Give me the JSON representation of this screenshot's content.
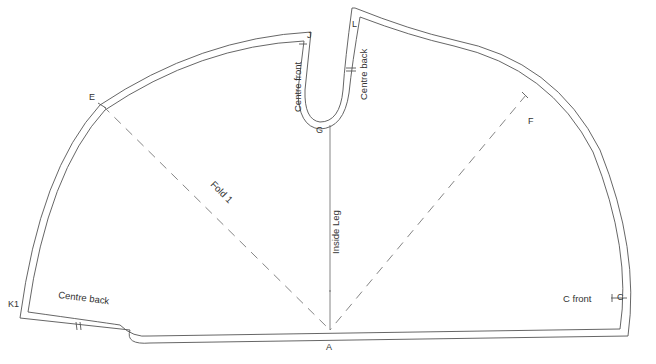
{
  "diagram": {
    "type": "sewing-pattern",
    "colors": {
      "line": "#555555",
      "text": "#333333",
      "background": "#ffffff"
    },
    "points": {
      "A": "A",
      "C": "C",
      "E": "E",
      "F": "F",
      "G": "G",
      "J": "J",
      "L": "L",
      "K1": "K1"
    },
    "annotations": {
      "centre_front_notch": "Centre front",
      "centre_back_notch": "Centre back",
      "centre_back_hem": "Centre back",
      "c_front": "C front",
      "fold": "Fold 1",
      "inside_leg": "Inside Leg"
    }
  }
}
